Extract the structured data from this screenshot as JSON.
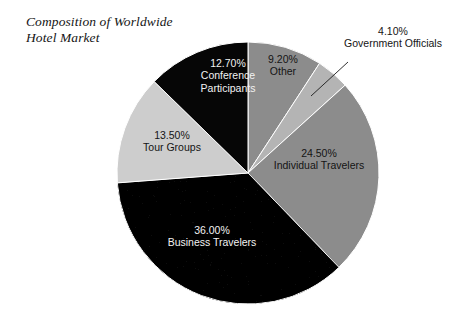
{
  "chart_data": {
    "type": "pie",
    "title": "Composition of Worldwide\nHotel Market",
    "categories": [
      "Other",
      "Government Officials",
      "Individual Travelers",
      "Business Travelers",
      "Tour Groups",
      "Conference Participants"
    ],
    "values": [
      9.2,
      4.1,
      24.5,
      36.0,
      13.5,
      12.7
    ],
    "value_labels": [
      "9.20%",
      "4.10%",
      "24.50%",
      "36.00%",
      "13.50%",
      "12.70%"
    ],
    "units": "percent",
    "start_angle_deg": 0,
    "direction": "clockwise",
    "legend": "none",
    "grid": false,
    "slices": [
      {
        "name": "Other",
        "value": 9.2,
        "value_label": "9.20%",
        "label_lines": [
          "9.20%",
          "Other"
        ],
        "color": "#8c8c8c",
        "label_color": "#141414",
        "label_placement": "inside",
        "label_anchor": "middle",
        "label_x": 283,
        "label_y": 66,
        "label_tone": "dark"
      },
      {
        "name": "Government Officials",
        "value": 4.1,
        "value_label": "4.10%",
        "label_lines": [
          "4.10%",
          "Government Officials"
        ],
        "color": "#b4b4b4",
        "label_color": "#141414",
        "label_placement": "outside",
        "label_anchor": "middle",
        "label_x": 393,
        "label_y": 41,
        "label_tone": "dark",
        "leader": {
          "x1": 348,
          "y1": 62,
          "x2": 311,
          "y2": 96
        }
      },
      {
        "name": "Individual Travelers",
        "value": 24.5,
        "value_label": "24.50%",
        "label_lines": [
          "24.50%",
          "Individual Travelers"
        ],
        "color": "#8c8c8c",
        "label_color": "#141414",
        "label_placement": "inside",
        "label_anchor": "middle",
        "label_x": 319,
        "label_y": 160,
        "label_tone": "dark"
      },
      {
        "name": "Business Travelers",
        "value": 36.0,
        "value_label": "36.00%",
        "label_lines": [
          "36.00%",
          "Business Travelers"
        ],
        "color": "#1c1c1c",
        "label_color": "#f2f2f2",
        "label_placement": "inside",
        "label_anchor": "middle",
        "label_x": 212,
        "label_y": 237,
        "label_tone": "light"
      },
      {
        "name": "Tour Groups",
        "value": 13.5,
        "value_label": "13.50%",
        "label_lines": [
          "13.50%",
          "Tour Groups"
        ],
        "color": "#cdcdcd",
        "label_color": "#141414",
        "label_placement": "inside",
        "label_anchor": "middle",
        "label_x": 172,
        "label_y": 142,
        "label_tone": "dark"
      },
      {
        "name": "Conference Participants",
        "value": 12.7,
        "value_label": "12.70%",
        "label_lines": [
          "12.70%",
          "Conference",
          "Participants"
        ],
        "color": "#060606",
        "label_color": "#f2f2f2",
        "label_placement": "inside",
        "label_anchor": "middle",
        "label_x": 228,
        "label_y": 76,
        "label_tone": "light"
      }
    ],
    "geometry": {
      "cx": 248,
      "cy": 173,
      "r": 131
    }
  }
}
